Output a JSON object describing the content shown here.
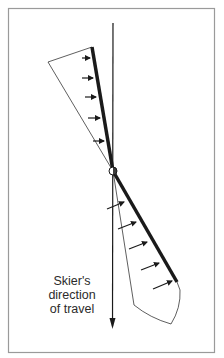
{
  "figure": {
    "label": {
      "line1": "Skier's",
      "line2": "direction",
      "line3": "of travel"
    },
    "colors": {
      "frame": "#9a9a9a",
      "ink": "#1a1a1a",
      "background": "#ffffff"
    },
    "elements": {
      "frame": "border-frame",
      "direction_axis": "vertical-arrow",
      "ski": "thick-line",
      "pivot": "circle",
      "upper_force_envelope": "triangle",
      "lower_force_envelope": "curved-wedge",
      "upper_force_arrows": 5,
      "lower_force_arrows": 5
    }
  }
}
